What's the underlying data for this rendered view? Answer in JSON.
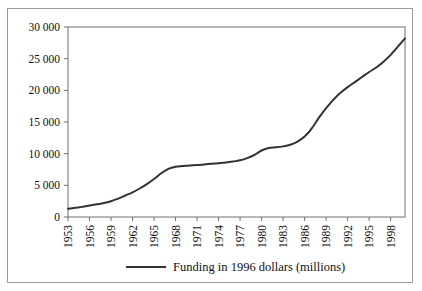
{
  "chart_data": {
    "type": "line",
    "title": "",
    "subtitle": "",
    "xlabel": "",
    "ylabel": "",
    "grid": false,
    "legend_position": "bottom",
    "xlim": [
      1953,
      2000
    ],
    "ylim": [
      0,
      30000
    ],
    "y_ticks": [
      0,
      5000,
      10000,
      15000,
      20000,
      25000,
      30000
    ],
    "y_tick_labels": [
      "0",
      "5 000",
      "10 000",
      "15 000",
      "20 000",
      "25 000",
      "30 000"
    ],
    "x_ticks": [
      1953,
      1956,
      1959,
      1962,
      1965,
      1968,
      1971,
      1974,
      1977,
      1980,
      1983,
      1986,
      1989,
      1992,
      1995,
      1998
    ],
    "x_tick_labels": [
      "1953",
      "1956",
      "1959",
      "1962",
      "1965",
      "1968",
      "1971",
      "1974",
      "1977",
      "1980",
      "1983",
      "1986",
      "1989",
      "1992",
      "1995",
      "1998"
    ],
    "x_tick_rotation": -90,
    "series": [
      {
        "name": "Funding in 1996 dollars (millions)",
        "color": "#333333",
        "line_width": 2,
        "x": [
          1953,
          1954,
          1955,
          1956,
          1957,
          1958,
          1959,
          1960,
          1961,
          1962,
          1963,
          1964,
          1965,
          1966,
          1967,
          1968,
          1969,
          1970,
          1971,
          1972,
          1973,
          1974,
          1975,
          1976,
          1977,
          1978,
          1979,
          1980,
          1981,
          1982,
          1983,
          1984,
          1985,
          1986,
          1987,
          1988,
          1989,
          1990,
          1991,
          1992,
          1993,
          1994,
          1995,
          1996,
          1997,
          1998,
          1999,
          2000
        ],
        "values": [
          1300,
          1450,
          1600,
          1800,
          2000,
          2200,
          2500,
          2900,
          3400,
          3900,
          4500,
          5200,
          6000,
          6900,
          7600,
          7950,
          8050,
          8150,
          8200,
          8300,
          8400,
          8500,
          8600,
          8750,
          8950,
          9300,
          9800,
          10500,
          10900,
          11000,
          11150,
          11400,
          11900,
          12700,
          14000,
          15700,
          17200,
          18500,
          19600,
          20500,
          21300,
          22100,
          22900,
          23600,
          24500,
          25600,
          26900,
          28200
        ]
      }
    ],
    "legend": [
      {
        "label": "Funding in 1996 dollars (millions)",
        "color": "#333333"
      }
    ]
  },
  "figure": {
    "border_color": "#9a9a9a",
    "background": "#ffffff",
    "axis_color": "#555555"
  }
}
